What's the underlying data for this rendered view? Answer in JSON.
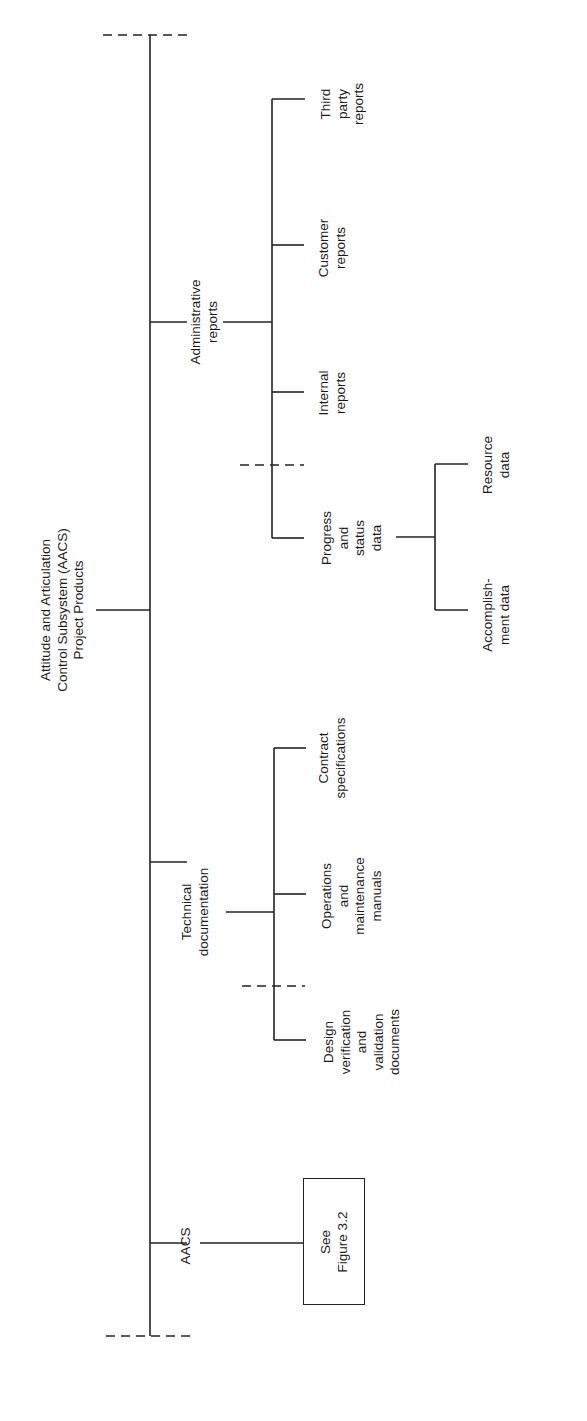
{
  "diagram": {
    "orientation": "rotated-90-ccw",
    "root": {
      "label": "Attitude and Articulation\nControl Subsystem (AACS)\nProject Products"
    },
    "branches": [
      {
        "label": "Administrative\nreports",
        "children": [
          {
            "label": "Third\nparty\nreports"
          },
          {
            "label": "Customer\nreports"
          },
          {
            "label": "Internal\nreports"
          },
          {
            "label": "Progress\nand\nstatus\ndata",
            "children": [
              {
                "label": "Resource\ndata"
              },
              {
                "label": "Accomplish-\nment data"
              }
            ]
          }
        ]
      },
      {
        "label": "Technical\ndocumentation",
        "children": [
          {
            "label": "Contract\nspecifications"
          },
          {
            "label": "Operations\nand\nmaintenance\nmanuals"
          },
          {
            "label": "Design\nverification\nand\nvalidation\ndocuments"
          }
        ]
      },
      {
        "label": "AACS",
        "reference_box": {
          "label": "See\nFigure 3.2"
        }
      }
    ]
  }
}
